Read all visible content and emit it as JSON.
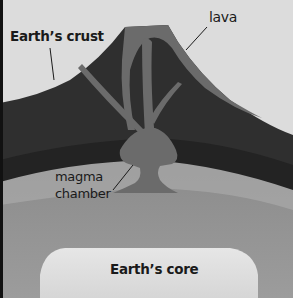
{
  "diagram": {
    "labels": {
      "crust": "Earth’s crust",
      "lava": "lava",
      "magma_line1": "magma",
      "magma_line2": "chamber",
      "core": "Earth’s core"
    },
    "colors": {
      "sky": "#dcdcdc",
      "crust": "#2f2f2f",
      "crust_band": "#232323",
      "lava": "#6b6b6b",
      "mantle_upper": "#8c8c8c",
      "mantle": "#9a9a9a",
      "core": "#e0e0e0",
      "left_border": "#111111"
    }
  }
}
